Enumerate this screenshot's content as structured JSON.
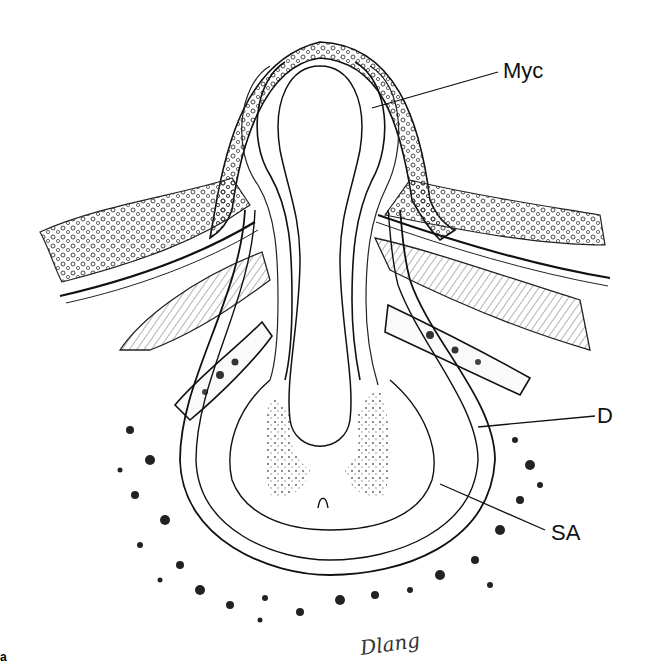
{
  "figure": {
    "panel_letter": "a",
    "signature": "Dlang",
    "labels": {
      "myc": "Myc",
      "d": "D",
      "sa": "SA"
    },
    "colors": {
      "ink": "#111111",
      "background": "#ffffff",
      "stipple": "#555555"
    }
  }
}
